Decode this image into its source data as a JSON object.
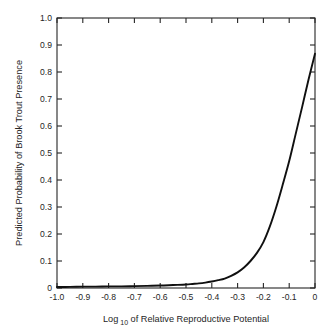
{
  "chart_data": {
    "type": "line",
    "title": "",
    "xlabel": "Log 10 of Relative Reproductive Potential",
    "xlabel_main": "Log",
    "xlabel_sub": "10",
    "xlabel_rest": "of Relative Reproductive Potential",
    "ylabel": "Predicted Probability of Brook Trout Presence",
    "xlim": [
      -1.0,
      0.0
    ],
    "ylim": [
      0.0,
      1.0
    ],
    "grid": false,
    "legend": "none",
    "line_color": "#101010",
    "xticklabels": [
      "-1.0",
      "-0.9",
      "-0.8",
      "-0.7",
      "-0.6",
      "-0.5",
      "-0.4",
      "-0.3",
      "-0.2",
      "-0.1",
      "0"
    ],
    "xtickvalues": [
      -1.0,
      -0.9,
      -0.8,
      -0.7,
      -0.6,
      -0.5,
      -0.4,
      -0.3,
      -0.2,
      -0.1,
      0.0
    ],
    "yticklabels": [
      "0",
      "0.1",
      "0.2",
      "0.3",
      "0.4",
      "0.5",
      "0.6",
      "0.7",
      "0.8",
      "0.9",
      "1.0"
    ],
    "ytickvalues": [
      0.0,
      0.1,
      0.2,
      0.3,
      0.4,
      0.5,
      0.6,
      0.7,
      0.8,
      0.9,
      1.0
    ],
    "series": [
      {
        "name": "Predicted probability",
        "x": [
          -1.0,
          -0.95,
          -0.9,
          -0.85,
          -0.8,
          -0.75,
          -0.7,
          -0.65,
          -0.6,
          -0.55,
          -0.5,
          -0.475,
          -0.45,
          -0.425,
          -0.4,
          -0.375,
          -0.35,
          -0.325,
          -0.3,
          -0.275,
          -0.25,
          -0.225,
          -0.2,
          -0.175,
          -0.15,
          -0.125,
          -0.1,
          -0.075,
          -0.05,
          -0.025,
          0.0
        ],
        "y": [
          0.004,
          0.004,
          0.005,
          0.005,
          0.006,
          0.006,
          0.007,
          0.008,
          0.009,
          0.011,
          0.013,
          0.015,
          0.017,
          0.02,
          0.024,
          0.029,
          0.035,
          0.045,
          0.058,
          0.076,
          0.1,
          0.13,
          0.17,
          0.228,
          0.3,
          0.383,
          0.47,
          0.57,
          0.67,
          0.772,
          0.868
        ]
      }
    ]
  },
  "axes": {
    "x_title_main": "Log",
    "x_title_sub": "10",
    "x_title_rest": "of Relative Reproductive Potential",
    "y_title": "Predicted Probability of Brook Trout Presence"
  }
}
